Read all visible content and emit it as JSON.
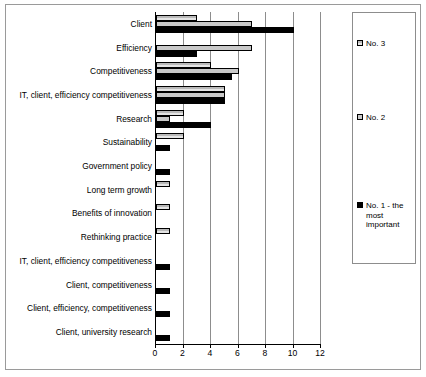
{
  "chart_data": {
    "type": "bar",
    "orientation": "horizontal",
    "title": "",
    "xlabel": "",
    "ylabel": "",
    "xlim": [
      0,
      12
    ],
    "xticks": [
      0,
      2,
      4,
      6,
      8,
      10,
      12
    ],
    "grid": true,
    "legend_position": "right",
    "categories": [
      "Client",
      "Efficiency",
      "Competitiveness",
      "IT, client, efficiency competitiveness",
      "Research",
      "Sustainability",
      "Government policy",
      "Long term growth",
      "Benefits of innovation",
      "Rethinking practice",
      "IT, client, efficiency competitiveness",
      "Client, competitiveness",
      "Client, efficiency, competitiveness",
      "Client, university research"
    ],
    "series": [
      {
        "name": "No. 3",
        "color": "#d4d4d4",
        "pattern": "hatched",
        "values": [
          3,
          0,
          4,
          5,
          2,
          2,
          0,
          1,
          1,
          1,
          0,
          0,
          0,
          0
        ]
      },
      {
        "name": "No. 2",
        "color": "#c9c9c9",
        "pattern": "solid-light",
        "values": [
          7,
          7,
          6,
          5,
          1,
          0,
          0,
          0,
          0,
          0,
          0,
          0,
          0,
          0
        ]
      },
      {
        "name": "No. 1 - the most important",
        "color": "#000000",
        "pattern": "solid-black",
        "values": [
          10,
          3,
          5.5,
          5,
          4,
          1,
          1,
          0,
          0,
          0,
          1,
          1,
          1,
          1
        ]
      }
    ]
  },
  "legend": {
    "entries": [
      {
        "label": "No. 3"
      },
      {
        "label": "No. 2"
      },
      {
        "label": "No. 1 - the most important"
      }
    ]
  }
}
